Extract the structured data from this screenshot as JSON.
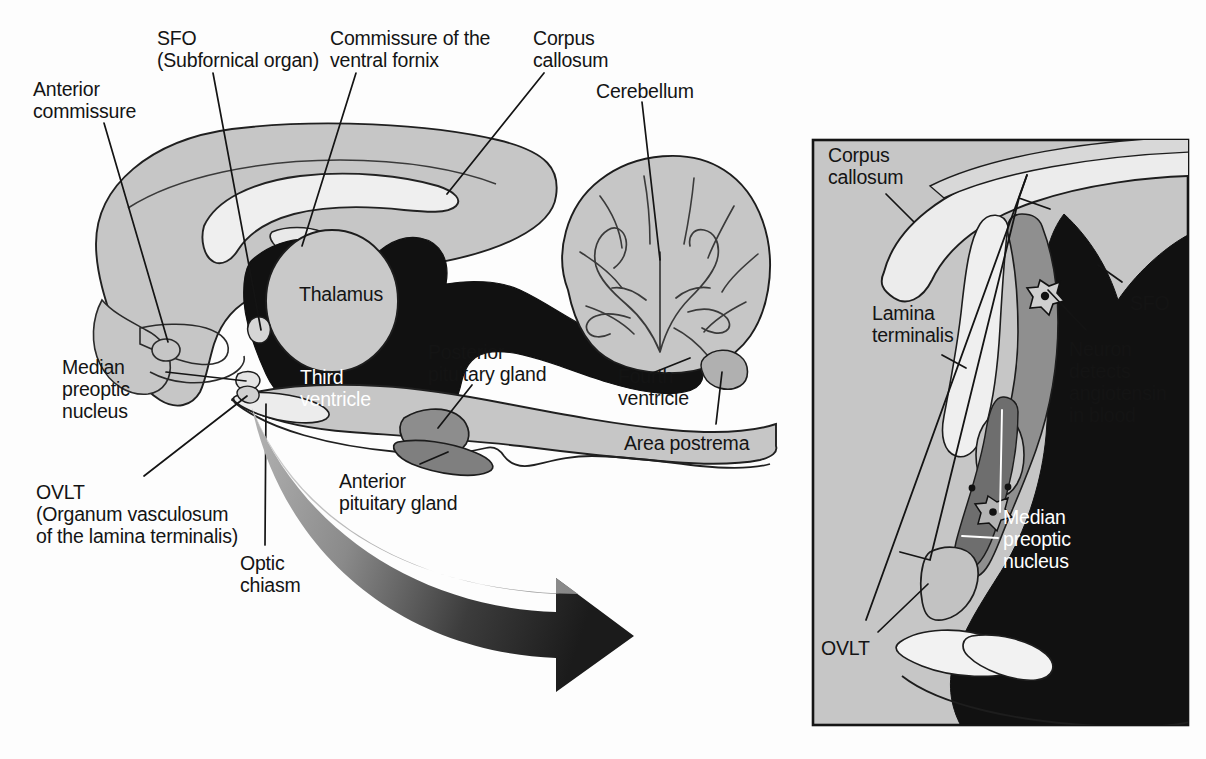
{
  "figure": {
    "background_color": "#fdfdfd",
    "ink_color": "#141414",
    "palette": {
      "brain_gray": "#c6c6c6",
      "pale_structure": "#e8e8e8",
      "white_matter": "#efefef",
      "ventricle_black": "#111111",
      "pituitary_mid": "#8d8d8d",
      "pituitary_dark": "#6e6e6e",
      "inset_background": "#c6c6c6",
      "arrow_light": "#9a9a9a",
      "arrow_dark": "#1b1b1b",
      "label_white": "#ffffff"
    }
  },
  "main_panel": {
    "labels": [
      {
        "id": "anterior-commissure",
        "text": "Anterior\ncommissure",
        "x": 33,
        "y": 78,
        "leader": true
      },
      {
        "id": "sfo",
        "text": "SFO\n(Subfornical organ)",
        "x": 157,
        "y": 27,
        "leader": true
      },
      {
        "id": "commissure-ventral-fornix",
        "text": "Commissure of the\nventral fornix",
        "x": 330,
        "y": 27,
        "leader": true
      },
      {
        "id": "corpus-callosum",
        "text": "Corpus\ncallosum",
        "x": 533,
        "y": 27,
        "leader": true
      },
      {
        "id": "cerebellum",
        "text": "Cerebellum",
        "x": 596,
        "y": 80,
        "leader": true
      },
      {
        "id": "thalamus",
        "text": "Thalamus",
        "x": 299,
        "y": 283,
        "leader": false
      },
      {
        "id": "median-preoptic-nucleus",
        "text": "Median\npreoptic\nnucleus",
        "x": 62,
        "y": 356,
        "leader": true
      },
      {
        "id": "third-ventricle",
        "text": "Third\nventricle",
        "x": 300,
        "y": 366,
        "leader": false,
        "white": true
      },
      {
        "id": "posterior-pituitary-gland",
        "text": "Posterior\npituitary gland",
        "x": 428,
        "y": 341,
        "leader": true
      },
      {
        "id": "fourth-ventricle",
        "text": "Fourth\nventricle",
        "x": 618,
        "y": 365,
        "leader": true
      },
      {
        "id": "area-postrema",
        "text": "Area postrema",
        "x": 624,
        "y": 432,
        "leader": true
      },
      {
        "id": "ovlt",
        "text": "OVLT\n(Organum vasculosum\nof the lamina terminalis)",
        "x": 36,
        "y": 481,
        "leader": true
      },
      {
        "id": "anterior-pituitary-gland",
        "text": "Anterior\npituitary gland",
        "x": 339,
        "y": 470,
        "leader": true
      },
      {
        "id": "optic-chiasm",
        "text": "Optic\nchiasm",
        "x": 240,
        "y": 552,
        "leader": true
      }
    ]
  },
  "inset_panel": {
    "frame": {
      "x": 811,
      "y": 138,
      "width": 379,
      "height": 589
    },
    "labels": [
      {
        "id": "inset-corpus-callosum",
        "text": "Corpus\ncallosum",
        "x": 828,
        "y": 144,
        "leader": true
      },
      {
        "id": "inset-lamina-terminalis",
        "text": "Lamina\nterminalis",
        "x": 872,
        "y": 302,
        "leader": true
      },
      {
        "id": "inset-sfo",
        "text": "SFO",
        "x": 1130,
        "y": 292,
        "leader": true
      },
      {
        "id": "inset-neuron-detects",
        "text": "Neuron\ndetects\nangiotensin\nin blood",
        "x": 1069,
        "y": 338,
        "leader": true
      },
      {
        "id": "inset-median-preoptic-nucleus",
        "text": "Median\npreoptic\nnucleus",
        "x": 1003,
        "y": 506,
        "leader": true,
        "white": true
      },
      {
        "id": "inset-ovlt",
        "text": "OVLT",
        "x": 821,
        "y": 637,
        "leader": true
      }
    ]
  },
  "arrow": {
    "id": "magnification-arrow",
    "description": "Curved gradient arrow pointing from main diagram to inset panel",
    "from_color": "#9a9a9a",
    "to_color": "#1b1b1b"
  }
}
